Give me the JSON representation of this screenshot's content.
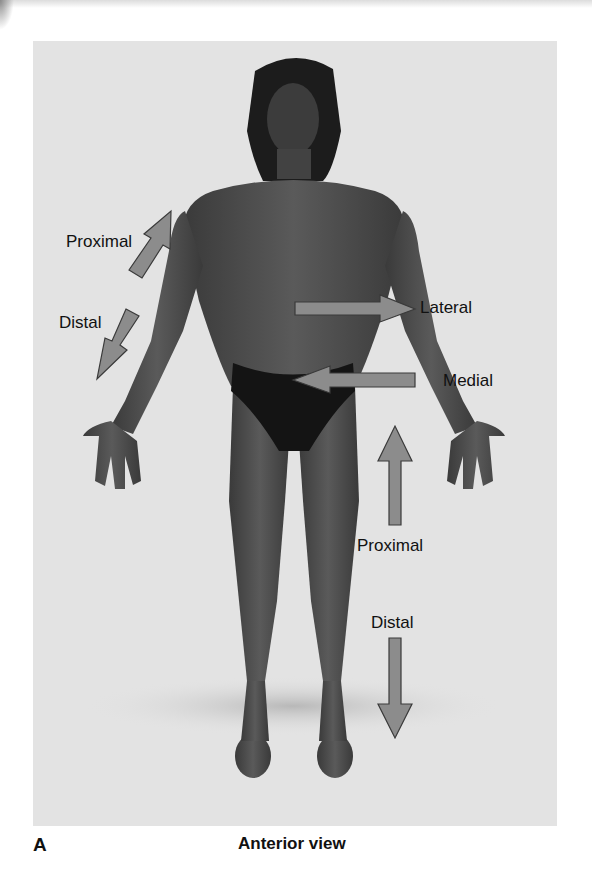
{
  "figure": {
    "panel_letter": "A",
    "caption": "Anterior view",
    "colors": {
      "background": "#ffffff",
      "photo_background": "#e3e3e3",
      "arrow_fill": "#8c8c8c",
      "arrow_stroke": "#3a3a3a",
      "skin": "#4a4a4a",
      "garment": "#141414",
      "label_text": "#111111"
    }
  },
  "labels": {
    "arm_proximal": "Proximal",
    "arm_distal": "Distal",
    "lateral": "Lateral",
    "medial": "Medial",
    "leg_proximal": "Proximal",
    "leg_distal": "Distal"
  },
  "arrows": [
    {
      "id": "arm-proximal",
      "direction": "up-right"
    },
    {
      "id": "arm-distal",
      "direction": "down-left"
    },
    {
      "id": "lateral",
      "direction": "right"
    },
    {
      "id": "medial",
      "direction": "left"
    },
    {
      "id": "leg-proximal",
      "direction": "up"
    },
    {
      "id": "leg-distal",
      "direction": "down"
    }
  ]
}
